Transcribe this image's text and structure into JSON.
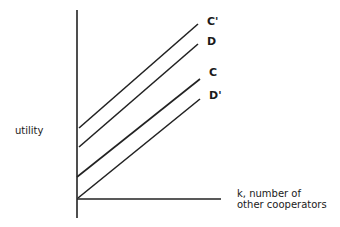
{
  "diagram": {
    "y_axis_label": "utility",
    "x_axis_label_line1": "k, number of",
    "x_axis_label_line2": "other cooperators",
    "colors": {
      "line": "#222222",
      "background": "#ffffff"
    },
    "curves": [
      {
        "label": "C'",
        "x1": 79,
        "y1": 128,
        "x2": 198,
        "y2": 24
      },
      {
        "label": "D",
        "x1": 79,
        "y1": 147,
        "x2": 198,
        "y2": 44
      },
      {
        "label": "C",
        "x1": 77,
        "y1": 177,
        "x2": 200,
        "y2": 79
      },
      {
        "label": "D'",
        "x1": 78,
        "y1": 198,
        "x2": 200,
        "y2": 99
      }
    ]
  }
}
